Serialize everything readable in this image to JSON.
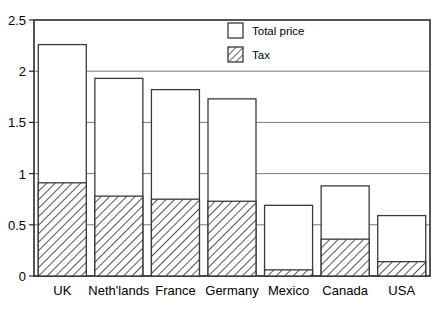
{
  "chart_data": {
    "type": "bar",
    "title": "",
    "subtitle": "",
    "xlabel": "",
    "ylabel": "",
    "ylim": [
      0,
      2.5
    ],
    "ytick_labels": [
      "0",
      "0.5",
      "1",
      "1.5",
      "2",
      "2.5"
    ],
    "ytick_values": [
      0,
      0.5,
      1,
      1.5,
      2,
      2.5
    ],
    "grid": true,
    "grid_axis": "y",
    "legend_position": "top-right",
    "stacked": true,
    "categories": [
      "UK",
      "Neth'lands",
      "France",
      "Germany",
      "Mexico",
      "Canada",
      "USA"
    ],
    "series": [
      {
        "name": "Total price",
        "style": "outline",
        "values": [
          2.26,
          1.93,
          1.82,
          1.73,
          0.69,
          0.88,
          0.59
        ]
      },
      {
        "name": "Tax",
        "style": "hatched",
        "values": [
          0.91,
          0.78,
          0.75,
          0.73,
          0.06,
          0.36,
          0.14
        ]
      }
    ]
  },
  "legend": {
    "items": [
      {
        "label": "Total price",
        "swatch": "empty-swatch-icon"
      },
      {
        "label": "Tax",
        "swatch": "hatched-swatch-icon"
      }
    ]
  },
  "colors": {
    "axis": "#2b2b2b",
    "grid": "#7a7a7a",
    "bar_fill": "#ffffff",
    "bar_stroke": "#3a3a3a",
    "hatch_stroke": "#2b2b2b",
    "background": "#ffffff",
    "text": "#000000"
  }
}
